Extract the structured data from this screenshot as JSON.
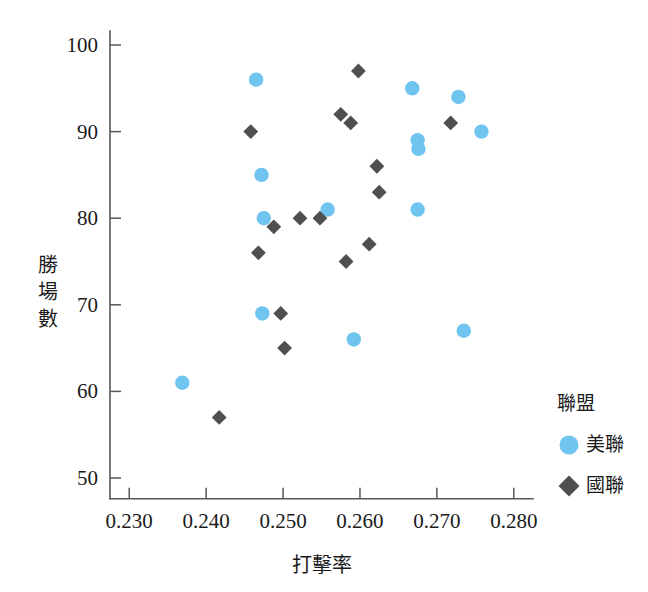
{
  "chart_data": {
    "type": "scatter",
    "title": "",
    "xlabel": "打擊率",
    "ylabel": "勝場數",
    "xlim": [
      0.2275,
      0.2825
    ],
    "ylim": [
      47.5,
      101.5
    ],
    "xticks": [
      "0.230",
      "0.240",
      "0.250",
      "0.260",
      "0.270",
      "0.280"
    ],
    "xtick_values": [
      0.23,
      0.24,
      0.25,
      0.26,
      0.27,
      0.28
    ],
    "yticks": [
      "50",
      "60",
      "70",
      "80",
      "90",
      "100"
    ],
    "ytick_values": [
      50,
      60,
      70,
      80,
      90,
      100
    ],
    "grid": false,
    "legend_position": "right",
    "legend": {
      "title": "聯盟",
      "entries": [
        {
          "name": "美聯",
          "marker": "circle",
          "color": "#6FC5F0"
        },
        {
          "name": "國聯",
          "marker": "diamond",
          "color": "#4F4F4F"
        }
      ]
    },
    "series": [
      {
        "name": "美聯",
        "marker": "circle",
        "color": "#6FC5F0",
        "points": [
          {
            "x": 0.2369,
            "y": 61
          },
          {
            "x": 0.2465,
            "y": 96
          },
          {
            "x": 0.2472,
            "y": 85
          },
          {
            "x": 0.2475,
            "y": 80
          },
          {
            "x": 0.2473,
            "y": 69
          },
          {
            "x": 0.2558,
            "y": 81
          },
          {
            "x": 0.2592,
            "y": 66
          },
          {
            "x": 0.2668,
            "y": 95
          },
          {
            "x": 0.2675,
            "y": 89
          },
          {
            "x": 0.2676,
            "y": 88
          },
          {
            "x": 0.2675,
            "y": 81
          },
          {
            "x": 0.2728,
            "y": 94
          },
          {
            "x": 0.2735,
            "y": 67
          },
          {
            "x": 0.2758,
            "y": 90
          }
        ]
      },
      {
        "name": "國聯",
        "marker": "diamond",
        "color": "#4F4F4F",
        "points": [
          {
            "x": 0.2417,
            "y": 57
          },
          {
            "x": 0.2458,
            "y": 90
          },
          {
            "x": 0.2468,
            "y": 76
          },
          {
            "x": 0.2488,
            "y": 79
          },
          {
            "x": 0.2497,
            "y": 69
          },
          {
            "x": 0.2502,
            "y": 65
          },
          {
            "x": 0.2522,
            "y": 80
          },
          {
            "x": 0.2548,
            "y": 80
          },
          {
            "x": 0.2575,
            "y": 92
          },
          {
            "x": 0.2588,
            "y": 91
          },
          {
            "x": 0.2598,
            "y": 97
          },
          {
            "x": 0.2582,
            "y": 75
          },
          {
            "x": 0.2612,
            "y": 77
          },
          {
            "x": 0.2622,
            "y": 86
          },
          {
            "x": 0.2625,
            "y": 83
          },
          {
            "x": 0.2718,
            "y": 91
          }
        ]
      }
    ]
  }
}
